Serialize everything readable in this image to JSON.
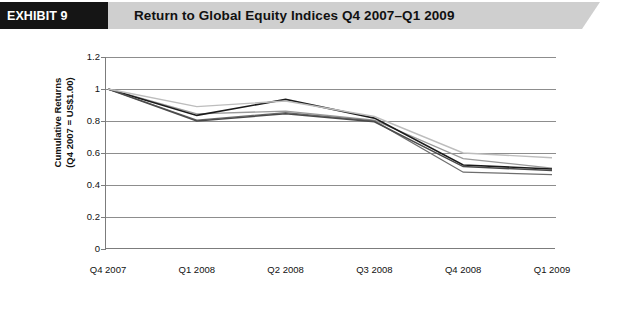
{
  "header": {
    "tag": "EXHIBIT 9",
    "title": "Return to Global Equity Indices Q4 2007–Q1 2009",
    "tag_bg": "#151515",
    "band_bg": "#cfcfcf"
  },
  "chart_data": {
    "type": "line",
    "title": "Return to Global Equity Indices Q4 2007–Q1 2009",
    "xlabel": "",
    "ylabel": "Cumulative Returns (Q4 2007 = US$1.00)",
    "ylabel_line1": "Cumulative Returns",
    "ylabel_line2": "(Q4 2007 = US$1.00)",
    "categories": [
      "Q4 2007",
      "Q1 2008",
      "Q2 2008",
      "Q3 2008",
      "Q4 2008",
      "Q1 2009"
    ],
    "ylim": [
      0,
      1.2
    ],
    "ytick_values": [
      1.2,
      1,
      0.8,
      0.6,
      0.4,
      0.2,
      0
    ],
    "ytick_labels": [
      "1.2",
      "1",
      "0.8",
      "0.6",
      "0.4",
      "0.2",
      "0"
    ],
    "grid": true,
    "legend_position": "bottom",
    "series": [
      {
        "name": "S&P 500",
        "color": "#9a9a9a",
        "width": 1.3,
        "values": [
          1.0,
          0.845,
          0.862,
          0.805,
          0.565,
          0.505
        ]
      },
      {
        "name": "MSCI EAFE US$",
        "color": "#1a1a1a",
        "width": 1.6,
        "values": [
          1.0,
          0.835,
          0.935,
          0.818,
          0.525,
          0.5
        ]
      },
      {
        "name": "HANG SENG",
        "color": "#6e6e6e",
        "width": 1.3,
        "values": [
          1.0,
          0.805,
          0.852,
          0.8,
          0.48,
          0.465
        ]
      },
      {
        "name": "NIKKEI 500",
        "color": "#4a4a4a",
        "width": 1.5,
        "values": [
          1.0,
          0.8,
          0.845,
          0.795,
          0.515,
          0.49
        ]
      },
      {
        "name": "MSCI AC EAFE + EM US$",
        "color": "#bdbdbd",
        "width": 1.4,
        "values": [
          1.0,
          0.89,
          0.925,
          0.828,
          0.6,
          0.57
        ]
      }
    ]
  }
}
